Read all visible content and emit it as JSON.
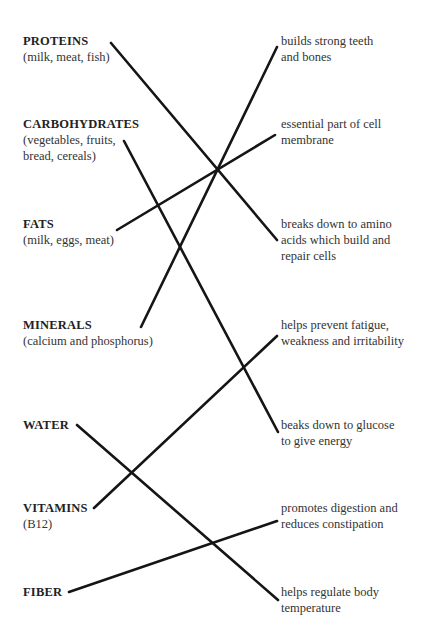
{
  "diagram": {
    "type": "matching",
    "nutrients": [
      {
        "name": "PROTEINS",
        "sources": "(milk, meat, fish)",
        "x": 23,
        "y": 33
      },
      {
        "name": "CARBOHYDRATES",
        "sources": "(vegetables, fruits, bread, cereals)",
        "x": 23,
        "y": 116
      },
      {
        "name": "FATS",
        "sources": "(milk, eggs, meat)",
        "x": 23,
        "y": 216
      },
      {
        "name": "MINERALS",
        "sources": "(calcium and phosphorus)",
        "x": 23,
        "y": 317
      },
      {
        "name": "WATER",
        "sources": "",
        "x": 23,
        "y": 417
      },
      {
        "name": "VITAMINS",
        "sources": "(B12)",
        "x": 23,
        "y": 500
      },
      {
        "name": "FIBER",
        "sources": "",
        "x": 23,
        "y": 584
      }
    ],
    "functions": [
      {
        "line1": "builds strong teeth",
        "line2": "and bones",
        "line3": "",
        "x": 281,
        "y": 33
      },
      {
        "line1": "essential part of cell",
        "line2": "membrane",
        "line3": "",
        "x": 281,
        "y": 116
      },
      {
        "line1": "breaks down to amino",
        "line2": "acids which build and",
        "line3": "repair cells",
        "x": 281,
        "y": 216
      },
      {
        "line1": "helps prevent fatigue,",
        "line2": "weakness and irritability",
        "line3": "",
        "x": 281,
        "y": 317
      },
      {
        "line1": "beaks down to glucose",
        "line2": "to give energy",
        "line3": "",
        "x": 281,
        "y": 417
      },
      {
        "line1": "promotes digestion and",
        "line2": "reduces constipation",
        "line3": "",
        "x": 281,
        "y": 500
      },
      {
        "line1": "helps regulate body",
        "line2": "temperature",
        "line3": "",
        "x": 281,
        "y": 584
      }
    ],
    "connections": [
      {
        "from": "PROTEINS",
        "to": "breaks down to amino acids which build and repair cells",
        "x1": 111,
        "y1": 43,
        "x2": 277,
        "y2": 240
      },
      {
        "from": "CARBOHYDRATES",
        "to": "beaks down to glucose to give energy",
        "x1": 124,
        "y1": 141,
        "x2": 278,
        "y2": 432
      },
      {
        "from": "FATS",
        "to": "essential part of cell membrane",
        "x1": 117,
        "y1": 230,
        "x2": 275,
        "y2": 135
      },
      {
        "from": "MINERALS",
        "to": "builds strong teeth and bones",
        "x1": 141,
        "y1": 327,
        "x2": 277,
        "y2": 47
      },
      {
        "from": "WATER",
        "to": "helps regulate body temperature",
        "x1": 77,
        "y1": 425,
        "x2": 278,
        "y2": 600
      },
      {
        "from": "VITAMINS",
        "to": "helps prevent fatigue, weakness and irritability",
        "x1": 94,
        "y1": 508,
        "x2": 277,
        "y2": 336
      },
      {
        "from": "FIBER",
        "to": "promotes digestion and reduces constipation",
        "x1": 69,
        "y1": 592,
        "x2": 277,
        "y2": 521
      }
    ]
  }
}
